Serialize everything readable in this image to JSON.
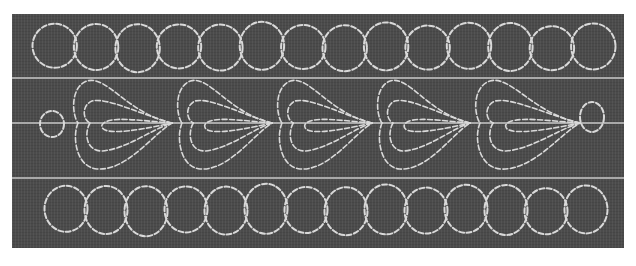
{
  "image": {
    "description": "Quilting stitch pattern on dark fabric: two rows of interlocking circular loops with a row of teardrop/petal feather motifs between them, separated by light horizontal guide lines",
    "colors": {
      "background": "#ffffff",
      "fabric": "#4b4b4b",
      "thread": "#d9d9d9",
      "guide_lines": "#a9a9a9"
    },
    "fabric_bounds": {
      "x": 12,
      "y": 14,
      "width": 612,
      "height": 234
    },
    "guide_lines_y": [
      78,
      123,
      178
    ],
    "rows": [
      {
        "name": "top-loop-row",
        "motif": "interlocking circles",
        "count": 14,
        "center_y": 47,
        "x_start": 34,
        "x_end": 614
      },
      {
        "name": "middle-feather-row",
        "motif": "teardrop petal clusters",
        "count": 5,
        "center_y": 123,
        "end_circles": 2
      },
      {
        "name": "bottom-loop-row",
        "motif": "interlocking circles",
        "count": 14,
        "center_y": 210,
        "x_start": 46,
        "x_end": 606
      }
    ]
  }
}
